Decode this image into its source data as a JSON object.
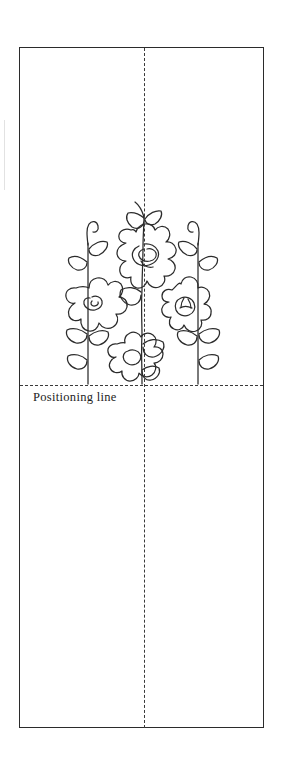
{
  "document": {
    "kind": "embroidery-pattern-template",
    "background_color": "#ffffff",
    "ink_color": "#2b2b2b",
    "guide_color": "#3a3a3a"
  },
  "frame": {
    "label": "pattern-border",
    "x": 19,
    "y": 47,
    "width": 245,
    "height": 681
  },
  "guides": {
    "center_line": {
      "label": "center fold line",
      "orientation": "vertical",
      "style": "dashed",
      "x": 144,
      "from_y": 48,
      "to_y": 728
    },
    "positioning_line": {
      "label": "Positioning line",
      "orientation": "horizontal",
      "style": "dashed",
      "y": 385,
      "from_x": 20,
      "to_x": 263
    }
  },
  "motif": {
    "name": "floral-spray",
    "description": "Four stylized flowers on leafy stems rising from the positioning line",
    "flower_count": 4,
    "stem_count": 3,
    "flowers": [
      {
        "name": "top-center-flower",
        "center_style": "spiral-swirl",
        "outline": "squared-lobed"
      },
      {
        "name": "left-flower",
        "center_style": "heart-petal",
        "outline": "round-lobed"
      },
      {
        "name": "right-flower",
        "center_style": "ribbed-oval",
        "outline": "scalloped"
      },
      {
        "name": "bottom-center-flower",
        "center_style": "teardrop-petal",
        "outline": "round-lobed"
      }
    ]
  }
}
